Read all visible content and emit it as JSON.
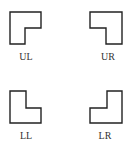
{
  "figure": {
    "shapes": [
      {
        "id": "UL",
        "label": "UL",
        "description": "L-shaped block with notch cut from lower-right"
      },
      {
        "id": "UR",
        "label": "UR",
        "description": "L-shaped block with notch cut from lower-left"
      },
      {
        "id": "LL",
        "label": "LL",
        "description": "L-shaped block with notch cut from upper-right"
      },
      {
        "id": "LR",
        "label": "LR",
        "description": "L-shaped block with notch cut from upper-left"
      }
    ],
    "stroke_color": "#222222",
    "background_color": "#ffffff"
  }
}
